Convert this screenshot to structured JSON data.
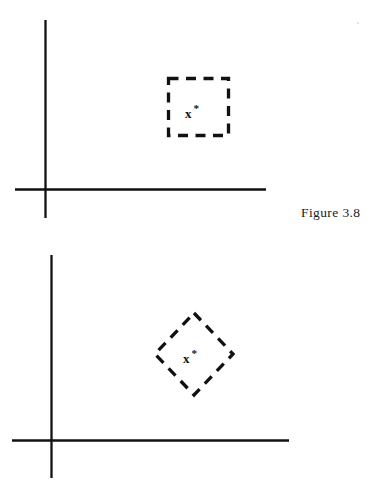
{
  "document": {
    "background_color": "#ffffff",
    "ink_color": "#111111",
    "width": 376,
    "height": 485,
    "kind": "scanned-textbook-figure"
  },
  "figures": [
    {
      "id": "figure-3-8",
      "caption": "Figure 3.8",
      "description": "Dashed square (box) constraint region with optimum point x* inside, drawn on a pair of coordinate axes",
      "axes": {
        "vertical": {
          "x": 45,
          "y_top": 20,
          "y_bottom": 218,
          "stroke_width": 2.2
        },
        "horizontal": {
          "y": 189,
          "x_left": 15,
          "x_right": 266,
          "stroke_width": 2.2
        }
      },
      "region": {
        "shape": "square",
        "stroke": "dashed",
        "stroke_width": 3.2,
        "dash_pattern": "9 7",
        "left": 168,
        "top": 78,
        "width": 60,
        "height": 57
      },
      "marker": {
        "label": "x",
        "superscript": "*",
        "x": 190,
        "y": 113,
        "style": "bold-serif"
      }
    },
    {
      "id": "figure-3-9",
      "caption": "Figure 3.9",
      "description": "Dashed diamond (rotated square) constraint region with optimum point x* inside, drawn on a pair of coordinate axes",
      "axes": {
        "vertical": {
          "x": 51,
          "y_top": 255,
          "y_bottom": 478,
          "stroke_width": 2.2
        },
        "horizontal": {
          "y": 440,
          "x_left": 12,
          "x_right": 289,
          "stroke_width": 2.2
        }
      },
      "region": {
        "shape": "diamond",
        "stroke": "dashed",
        "stroke_width": 3.2,
        "dash_pattern": "9 7",
        "left": 155,
        "top": 313,
        "width": 78,
        "height": 82
      },
      "marker": {
        "label": "x",
        "superscript": "*",
        "x": 188,
        "y": 358,
        "style": "bold-serif"
      }
    }
  ],
  "captions": {
    "figure_38": "Figure 3.8",
    "figure_39": "Figure 3.9"
  },
  "markers": {
    "optimum_label": "x",
    "optimum_superscript": "*"
  }
}
